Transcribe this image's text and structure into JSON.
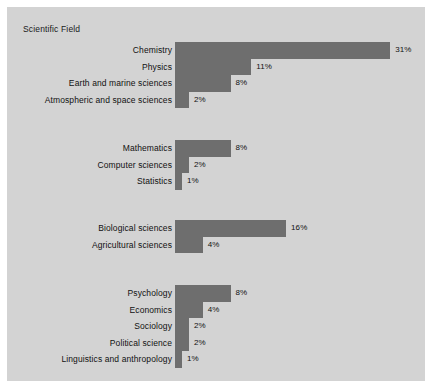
{
  "chart_title": "Scientific Field",
  "colors": {
    "panel_background": "#d3d3d3",
    "bar": "#6e6e6e",
    "text": "#111111",
    "page_background": "#ffffff"
  },
  "chart_data": {
    "type": "bar",
    "orientation": "horizontal",
    "title": "Scientific Field",
    "xlabel": "",
    "ylabel": "",
    "xlim": [
      0,
      31
    ],
    "grid": false,
    "legend": null,
    "value_suffix": "%",
    "groups": [
      {
        "name": "physical-sciences",
        "categories": [
          "Chemistry",
          "Physics",
          "Earth and marine sciences",
          "Atmospheric and space sciences"
        ],
        "values": [
          31,
          11,
          8,
          2
        ],
        "value_labels": [
          "31%",
          "11%",
          "8%",
          "2%"
        ]
      },
      {
        "name": "mathematical-sciences",
        "categories": [
          "Mathematics",
          "Computer sciences",
          "Statistics"
        ],
        "values": [
          8,
          2,
          1
        ],
        "value_labels": [
          "8%",
          "2%",
          "1%"
        ]
      },
      {
        "name": "life-sciences",
        "categories": [
          "Biological sciences",
          "Agricultural sciences"
        ],
        "values": [
          16,
          4
        ],
        "value_labels": [
          "16%",
          "4%"
        ]
      },
      {
        "name": "social-sciences",
        "categories": [
          "Psychology",
          "Economics",
          "Sociology",
          "Political science",
          "Linguistics and anthropology"
        ],
        "values": [
          8,
          4,
          2,
          2,
          1
        ],
        "value_labels": [
          "8%",
          "4%",
          "2%",
          "2%",
          "1%"
        ]
      }
    ]
  },
  "layout": {
    "group_tops": [
      35,
      133,
      213,
      278
    ],
    "px_per_percent": 6.94,
    "row_height": 16.5
  }
}
